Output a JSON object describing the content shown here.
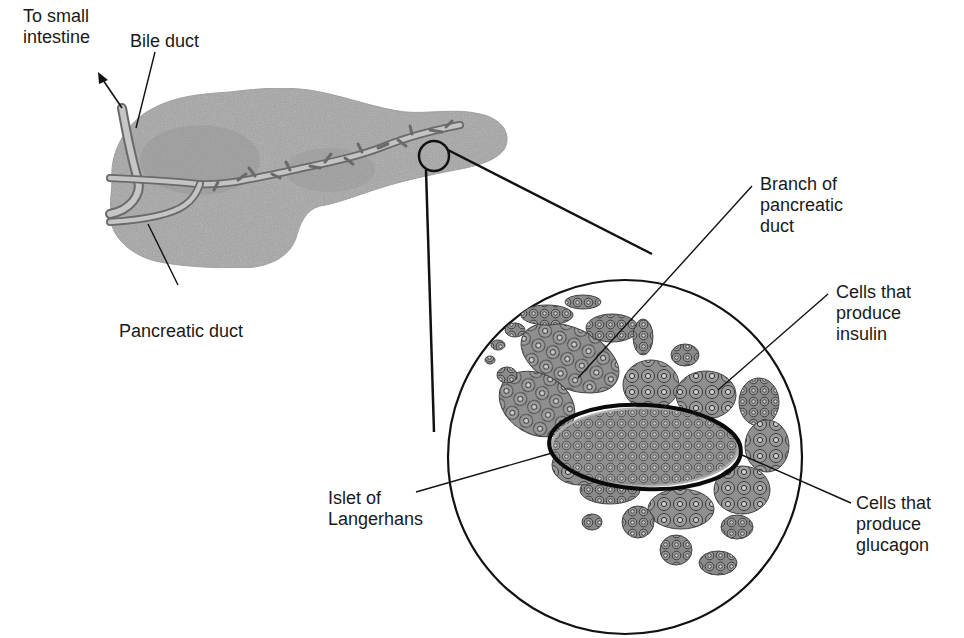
{
  "diagram": {
    "colors": {
      "organ_fill": "#a9a9a9",
      "organ_dark": "#8a8a8a",
      "duct_fill": "#c4c4c4",
      "duct_edge": "#6a6a6a",
      "cell_fill": "#8f8f8f",
      "cell_edge": "#3a3a3a",
      "line": "#111111",
      "background": "#ffffff"
    },
    "labels": {
      "to_small_intestine": "To small\nintestine",
      "bile_duct": "Bile duct",
      "pancreatic_duct": "Pancreatic duct",
      "branch_of_pancreatic_duct": "Branch of\npancreatic\nduct",
      "cells_insulin": "Cells that\nproduce\ninsulin",
      "islet_of_langerhans": "Islet of\nLangerhans",
      "cells_glucagon": "Cells that\nproduce\nglucagon"
    },
    "nodes": [
      {
        "id": "pancreas",
        "label": "Pancreas (organ)"
      },
      {
        "id": "bile_duct",
        "label": "Bile duct"
      },
      {
        "id": "pancreatic_duct",
        "label": "Pancreatic duct"
      },
      {
        "id": "magnified_region",
        "label": "Magnified view"
      },
      {
        "id": "islet",
        "label": "Islet of Langerhans"
      },
      {
        "id": "insulin_cells",
        "label": "Cells that produce insulin"
      },
      {
        "id": "glucagon_cells",
        "label": "Cells that produce glucagon"
      },
      {
        "id": "duct_branch",
        "label": "Branch of pancreatic duct"
      }
    ],
    "edges": [
      {
        "from": "bile_duct",
        "to": "small_intestine",
        "label": "To small intestine"
      },
      {
        "from": "pancreas",
        "to": "magnified_region",
        "label": "zoom"
      }
    ]
  }
}
